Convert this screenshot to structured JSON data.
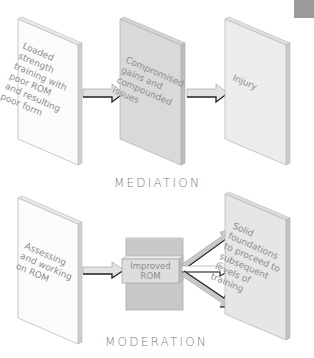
{
  "corner_tab": {
    "color": "#9a9a9a"
  },
  "mediation": {
    "title": "MEDIATION",
    "panels": [
      {
        "lines": [
          "Loaded",
          "strength",
          "training with",
          "poor ROM",
          "and resulting",
          "poor form"
        ],
        "fill": "#fbfbfb"
      },
      {
        "lines": [
          "Compromised",
          "gains and",
          "compounded",
          "issues"
        ],
        "fill": "#d9d9d9"
      },
      {
        "lines": [
          "Injury"
        ],
        "fill": "#ececec"
      }
    ]
  },
  "moderation": {
    "title": "MODERATION",
    "panels": [
      {
        "lines": [
          "Assessing",
          "and working",
          "on ROM"
        ],
        "fill": "#fbfbfb"
      },
      {
        "lines": [
          "Solid",
          "foundations",
          "to proceed to",
          "subsequent",
          "levels of",
          "training"
        ],
        "fill": "#e6e6e6"
      }
    ],
    "center_box": {
      "lines": [
        "Improved",
        "ROM"
      ],
      "block_fill": "#c8c8c8",
      "label_fill": "#dddddd"
    }
  },
  "colors": {
    "text": "#8d8d8d",
    "edge": "#bdbdbd",
    "side": "#cfcfcf",
    "arrow_dark": "#2a2a2a",
    "arrow_fill": "#e2e2e2"
  }
}
